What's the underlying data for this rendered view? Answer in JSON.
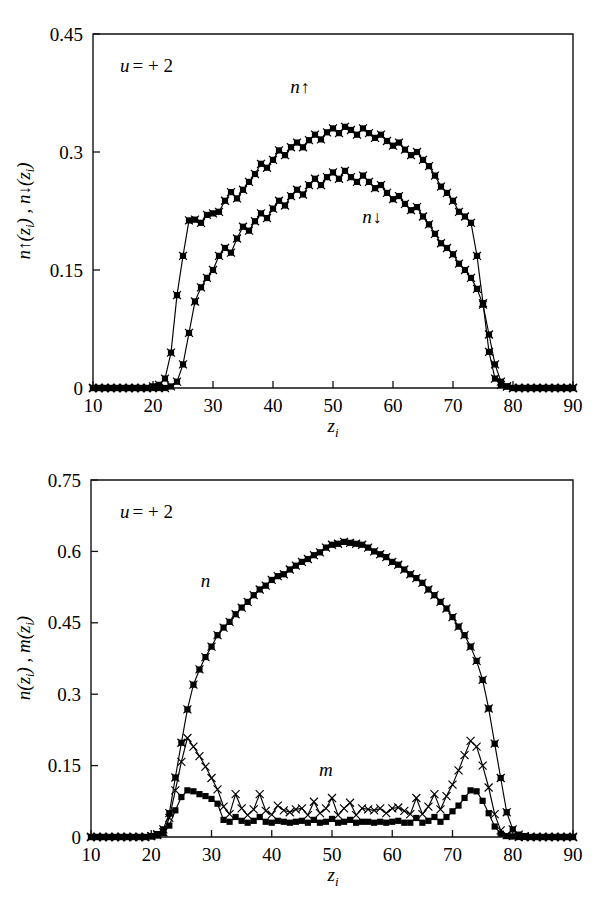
{
  "figure": {
    "background": "#ffffff",
    "ink": "#000000",
    "width": 605,
    "height": 902
  },
  "chart_data": [
    {
      "type": "line",
      "panel": "top",
      "title": "",
      "xlabel": "z",
      "xlabel_sub": "i",
      "ylabel": "n↑(z i) , n↓(z i)",
      "ylabel_parts": [
        "n",
        "↑",
        "(z",
        "i",
        ") , ",
        "n",
        "↓",
        "(z",
        "i",
        ")"
      ],
      "annotation": "u = + 2",
      "annotation_symbol": "u",
      "annotation_rest": "= + 2",
      "grid": false,
      "legend_position": "inline",
      "xlim": [
        10,
        90
      ],
      "ylim": [
        0,
        0.45
      ],
      "xticks": [
        10,
        20,
        30,
        40,
        50,
        60,
        70,
        80,
        90
      ],
      "xticklabels": [
        "10",
        "20",
        "30",
        "40",
        "50",
        "60",
        "70",
        "80",
        "90"
      ],
      "yticks": [
        0,
        0.15,
        0.3,
        0.45
      ],
      "yticklabels": [
        "0",
        "0.15",
        "0.3",
        "0.45"
      ],
      "x": [
        10,
        11,
        12,
        13,
        14,
        15,
        16,
        17,
        18,
        19,
        20,
        21,
        22,
        23,
        24,
        25,
        26,
        27,
        28,
        29,
        30,
        31,
        32,
        33,
        34,
        35,
        36,
        37,
        38,
        39,
        40,
        41,
        42,
        43,
        44,
        45,
        46,
        47,
        48,
        49,
        50,
        51,
        52,
        53,
        54,
        55,
        56,
        57,
        58,
        59,
        60,
        61,
        62,
        63,
        64,
        65,
        66,
        67,
        68,
        69,
        70,
        71,
        72,
        73,
        74,
        75,
        76,
        77,
        78,
        79,
        80,
        81,
        82,
        83,
        84,
        85,
        86,
        87,
        88,
        89,
        90
      ],
      "series": [
        {
          "name": "n↑",
          "label": "n↑",
          "marker": "square-cross",
          "label_x": 44.5,
          "label_y": 0.375,
          "values": [
            0,
            0,
            0,
            0,
            0,
            0,
            0,
            0,
            0,
            0,
            0.002,
            0.004,
            0.012,
            0.045,
            0.118,
            0.168,
            0.213,
            0.214,
            0.21,
            0.22,
            0.222,
            0.224,
            0.238,
            0.249,
            0.241,
            0.252,
            0.262,
            0.272,
            0.285,
            0.28,
            0.29,
            0.302,
            0.296,
            0.306,
            0.312,
            0.306,
            0.315,
            0.322,
            0.316,
            0.325,
            0.33,
            0.324,
            0.332,
            0.328,
            0.322,
            0.33,
            0.324,
            0.318,
            0.322,
            0.314,
            0.308,
            0.312,
            0.303,
            0.296,
            0.3,
            0.29,
            0.282,
            0.27,
            0.256,
            0.248,
            0.238,
            0.224,
            0.218,
            0.21,
            0.168,
            0.108,
            0.046,
            0.012,
            0.004,
            0.002,
            0,
            0,
            0,
            0,
            0,
            0,
            0,
            0,
            0,
            0,
            0
          ]
        },
        {
          "name": "n↓",
          "label": "n↓",
          "marker": "square-cross",
          "label_x": 56.5,
          "label_y": 0.21,
          "values": [
            0,
            0,
            0,
            0,
            0,
            0,
            0,
            0,
            0,
            0,
            0,
            0,
            0,
            0.002,
            0.008,
            0.03,
            0.07,
            0.11,
            0.128,
            0.14,
            0.15,
            0.168,
            0.178,
            0.172,
            0.19,
            0.205,
            0.2,
            0.212,
            0.222,
            0.216,
            0.228,
            0.238,
            0.232,
            0.244,
            0.252,
            0.246,
            0.258,
            0.266,
            0.258,
            0.268,
            0.274,
            0.266,
            0.276,
            0.268,
            0.262,
            0.27,
            0.262,
            0.254,
            0.258,
            0.248,
            0.24,
            0.244,
            0.234,
            0.226,
            0.23,
            0.218,
            0.208,
            0.196,
            0.184,
            0.178,
            0.17,
            0.158,
            0.15,
            0.14,
            0.126,
            0.106,
            0.068,
            0.03,
            0.008,
            0.002,
            0,
            0,
            0,
            0,
            0,
            0,
            0,
            0,
            0,
            0,
            0
          ]
        }
      ]
    },
    {
      "type": "line",
      "panel": "bottom",
      "title": "",
      "xlabel": "z",
      "xlabel_sub": "i",
      "ylabel": "n(z i) , m(z i)",
      "ylabel_parts": [
        "n",
        "(z",
        "i",
        ") , ",
        "m",
        "(z",
        "i",
        ")"
      ],
      "annotation": "u = + 2",
      "annotation_symbol": "u",
      "annotation_rest": "= + 2",
      "grid": false,
      "legend_position": "inline",
      "xlim": [
        10,
        90
      ],
      "ylim": [
        0,
        0.75
      ],
      "xticks": [
        10,
        20,
        30,
        40,
        50,
        60,
        70,
        80,
        90
      ],
      "xticklabels": [
        "10",
        "20",
        "30",
        "40",
        "50",
        "60",
        "70",
        "80",
        "90"
      ],
      "yticks": [
        0,
        0.15,
        0.3,
        0.45,
        0.6,
        0.75
      ],
      "yticklabels": [
        "0",
        "0.15",
        "0.3",
        "0.45",
        "0.6",
        "0.75"
      ],
      "x": [
        10,
        11,
        12,
        13,
        14,
        15,
        16,
        17,
        18,
        19,
        20,
        21,
        22,
        23,
        24,
        25,
        26,
        27,
        28,
        29,
        30,
        31,
        32,
        33,
        34,
        35,
        36,
        37,
        38,
        39,
        40,
        41,
        42,
        43,
        44,
        45,
        46,
        47,
        48,
        49,
        50,
        51,
        52,
        53,
        54,
        55,
        56,
        57,
        58,
        59,
        60,
        61,
        62,
        63,
        64,
        65,
        66,
        67,
        68,
        69,
        70,
        71,
        72,
        73,
        74,
        75,
        76,
        77,
        78,
        79,
        80,
        81,
        82,
        83,
        84,
        85,
        86,
        87,
        88,
        89,
        90
      ],
      "series": [
        {
          "name": "n",
          "label": "n",
          "marker": "square-cross",
          "label_x": 29.0,
          "label_y": 0.525,
          "values": [
            0,
            0,
            0,
            0,
            0,
            0,
            0,
            0,
            0,
            0,
            0.002,
            0.006,
            0.016,
            0.05,
            0.125,
            0.198,
            0.268,
            0.32,
            0.352,
            0.378,
            0.4,
            0.424,
            0.44,
            0.452,
            0.468,
            0.482,
            0.494,
            0.508,
            0.52,
            0.528,
            0.54,
            0.548,
            0.552,
            0.562,
            0.57,
            0.578,
            0.584,
            0.592,
            0.598,
            0.608,
            0.614,
            0.616,
            0.62,
            0.618,
            0.616,
            0.614,
            0.608,
            0.6,
            0.594,
            0.588,
            0.578,
            0.572,
            0.562,
            0.552,
            0.544,
            0.534,
            0.52,
            0.508,
            0.494,
            0.48,
            0.462,
            0.442,
            0.424,
            0.4,
            0.37,
            0.33,
            0.27,
            0.196,
            0.124,
            0.052,
            0.016,
            0.005,
            0.002,
            0,
            0,
            0,
            0,
            0,
            0,
            0,
            0
          ]
        },
        {
          "name": "m",
          "label": "m",
          "marker": "cross",
          "label_x": 49.0,
          "label_y": 0.128,
          "values": [
            0,
            0,
            0,
            0,
            0,
            0,
            0,
            0,
            0,
            0,
            0.002,
            0.004,
            0.01,
            0.04,
            0.098,
            0.158,
            0.208,
            0.19,
            0.17,
            0.148,
            0.124,
            0.1,
            0.064,
            0.048,
            0.09,
            0.06,
            0.046,
            0.058,
            0.09,
            0.055,
            0.047,
            0.066,
            0.056,
            0.052,
            0.058,
            0.06,
            0.046,
            0.074,
            0.05,
            0.06,
            0.082,
            0.046,
            0.06,
            0.072,
            0.046,
            0.06,
            0.058,
            0.056,
            0.06,
            0.05,
            0.06,
            0.062,
            0.055,
            0.048,
            0.082,
            0.048,
            0.064,
            0.09,
            0.058,
            0.086,
            0.11,
            0.14,
            0.172,
            0.202,
            0.19,
            0.15,
            0.104,
            0.048,
            0.014,
            0.004,
            0.002,
            0,
            0,
            0,
            0,
            0,
            0,
            0,
            0,
            0,
            0
          ]
        },
        {
          "name": "m-squares",
          "label": "",
          "marker": "square",
          "label_x": null,
          "label_y": null,
          "values": [
            0,
            0,
            0,
            0,
            0,
            0,
            0,
            0,
            0,
            0,
            0.001,
            0.003,
            0.008,
            0.024,
            0.056,
            0.084,
            0.098,
            0.096,
            0.09,
            0.086,
            0.08,
            0.07,
            0.036,
            0.032,
            0.042,
            0.034,
            0.03,
            0.034,
            0.042,
            0.032,
            0.03,
            0.034,
            0.032,
            0.03,
            0.032,
            0.034,
            0.03,
            0.036,
            0.03,
            0.032,
            0.038,
            0.03,
            0.032,
            0.036,
            0.03,
            0.032,
            0.032,
            0.03,
            0.032,
            0.03,
            0.032,
            0.034,
            0.03,
            0.03,
            0.04,
            0.03,
            0.034,
            0.042,
            0.032,
            0.042,
            0.054,
            0.066,
            0.082,
            0.098,
            0.096,
            0.076,
            0.05,
            0.022,
            0.007,
            0.002,
            0.001,
            0,
            0,
            0,
            0,
            0,
            0,
            0,
            0,
            0,
            0
          ]
        }
      ]
    }
  ]
}
